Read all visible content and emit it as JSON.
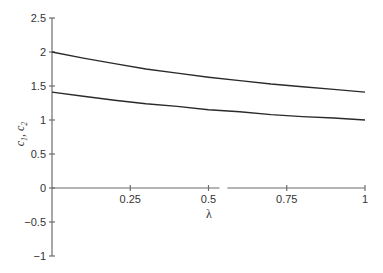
{
  "chart_data": {
    "type": "line",
    "title": "",
    "xlabel": "λ",
    "ylabel": "c1, c2",
    "xlim": [
      0,
      1
    ],
    "ylim": [
      -1,
      2.5
    ],
    "grid": false,
    "legend": null,
    "x_ticks": [
      0.25,
      0.5,
      0.75,
      1
    ],
    "x_tick_labels": [
      "0.25",
      "0.5",
      "0.75",
      "1"
    ],
    "y_ticks": [
      -1,
      -0.5,
      0,
      0.5,
      1,
      1.5,
      2,
      2.5
    ],
    "y_tick_labels": [
      "−1",
      "−0.5",
      "0",
      "0.5",
      "1",
      "1.5",
      "2",
      "2.5"
    ],
    "x": [
      0,
      0.1,
      0.2,
      0.3,
      0.4,
      0.5,
      0.6,
      0.7,
      0.8,
      0.9,
      1.0
    ],
    "series": [
      {
        "name": "c1",
        "values": [
          2.0,
          1.91,
          1.83,
          1.75,
          1.69,
          1.63,
          1.58,
          1.53,
          1.49,
          1.45,
          1.41
        ]
      },
      {
        "name": "c2",
        "values": [
          1.41,
          1.35,
          1.29,
          1.24,
          1.2,
          1.15,
          1.12,
          1.08,
          1.05,
          1.03,
          1.0
        ]
      }
    ],
    "colors": {
      "axis": "#6d6d6d",
      "curve": "#2a2a2a",
      "text": "#333333"
    }
  }
}
